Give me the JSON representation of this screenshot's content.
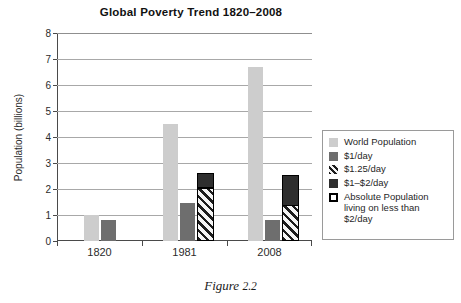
{
  "chart_data": {
    "type": "bar",
    "title": "Global Poverty Trend 1820–2008",
    "xlabel": "",
    "ylabel": "Population (billions)",
    "categories": [
      "1820",
      "1981",
      "2008"
    ],
    "ylim": [
      0,
      8
    ],
    "yticks": [
      "0",
      "1",
      "2",
      "3",
      "4",
      "5",
      "6",
      "7",
      "8"
    ],
    "grid": true,
    "legend_position": "right",
    "series": [
      {
        "name": "World Population",
        "style": "solid-light-gray",
        "color": "#cdcdcd",
        "values": [
          1.0,
          4.5,
          6.7
        ]
      },
      {
        "name": "$1/day",
        "style": "solid-medium-gray",
        "color": "#6e6e6e",
        "values": [
          0.8,
          1.45,
          0.82
        ]
      },
      {
        "name": "$1.25/day",
        "style": "diagonal-hatch",
        "color": "#1c1c1c",
        "values": [
          null,
          1.97,
          1.3
        ]
      },
      {
        "name": "$1–$2/day",
        "style": "solid-dark",
        "color": "#2e2e2e",
        "values": [
          null,
          2.63,
          2.53
        ],
        "note": "stacked top of outlined bar; segment above the $1.25/day hatch"
      },
      {
        "name": "Absolute Population living on less than $2/day",
        "style": "black-outline",
        "color": "#000000",
        "values": [
          null,
          2.63,
          2.53
        ],
        "note": "outline encloses the stacked $1.25/day + $1–$2/day bar"
      }
    ]
  },
  "legend": {
    "items": [
      {
        "swatch": "solid-light-gray",
        "label": "World Population"
      },
      {
        "swatch": "solid-medium-gray",
        "label": "$1/day"
      },
      {
        "swatch": "diagonal-hatch",
        "label": "$1.25/day"
      },
      {
        "swatch": "solid-dark",
        "label": "$1–$2/day"
      },
      {
        "swatch": "black-outline",
        "label": "Absolute Population living on less than $2/day"
      }
    ]
  },
  "caption": {
    "prefix": "Figure",
    "number": "2.2"
  },
  "colors": {
    "world_population": "#cdcdcd",
    "dollar_per_day": "#6e6e6e",
    "one_two_per_day": "#2e2e2e",
    "hatch": "#1c1c1c",
    "outline": "#000000",
    "gridline": "#a8a8a8",
    "axis": "#4a4a4a"
  }
}
